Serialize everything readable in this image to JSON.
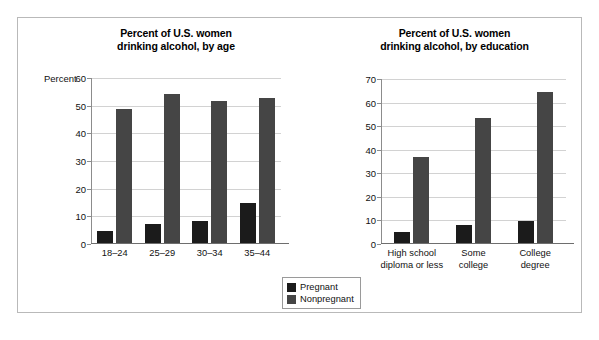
{
  "figure": {
    "legend": {
      "entries": [
        {
          "label": "Pregnant",
          "color": "#1b1b1b",
          "key": "pregnant"
        },
        {
          "label": "Nonpregnant",
          "color": "#454545",
          "key": "nonpregnant"
        }
      ]
    }
  },
  "chart_data": [
    {
      "type": "bar",
      "id": "by-age",
      "title": "Percent of U.S. women\ndrinking alcohol, by age",
      "title_line1": "Percent of U.S. women",
      "title_line2": "drinking alcohol, by age",
      "xlabel": "",
      "ylabel": "Percent",
      "ylim": [
        0,
        60
      ],
      "yticks": [
        0,
        10,
        20,
        30,
        40,
        50,
        60
      ],
      "ytick_labels": [
        "0",
        "10",
        "20",
        "30",
        "40",
        "50",
        "60"
      ],
      "grid": true,
      "legend_position": "bottom-center",
      "categories": [
        "18–24",
        "25–29",
        "30–34",
        "35–44"
      ],
      "series": [
        {
          "name": "Pregnant",
          "color": "#1b1b1b",
          "values": [
            4.5,
            7.0,
            7.8,
            14.3
          ]
        },
        {
          "name": "Nonpregnant",
          "color": "#454545",
          "values": [
            48.5,
            54.0,
            51.5,
            52.5
          ]
        }
      ]
    },
    {
      "type": "bar",
      "id": "by-education",
      "title": "Percent of U.S. women\ndrinking alcohol, by education",
      "title_line1": "Percent of U.S. women",
      "title_line2": "drinking alcohol, by education",
      "xlabel": "",
      "ylabel": "Percent",
      "ylim": [
        0,
        70
      ],
      "yticks": [
        0,
        10,
        20,
        30,
        40,
        50,
        60,
        70
      ],
      "ytick_labels": [
        "0",
        "10",
        "20",
        "30",
        "40",
        "50",
        "60",
        "70"
      ],
      "grid": true,
      "legend_position": "bottom-center",
      "categories": [
        "High school\ndiploma or less",
        "Some\ncollege",
        "College\ndegree"
      ],
      "category_lines": [
        [
          "High school",
          "diploma or less"
        ],
        [
          "Some",
          "college"
        ],
        [
          "College",
          "degree"
        ]
      ],
      "series": [
        {
          "name": "Pregnant",
          "color": "#1b1b1b",
          "values": [
            4.5,
            7.5,
            9.5
          ]
        },
        {
          "name": "Nonpregnant",
          "color": "#454545",
          "values": [
            36.5,
            53.0,
            64.0
          ]
        }
      ]
    }
  ]
}
